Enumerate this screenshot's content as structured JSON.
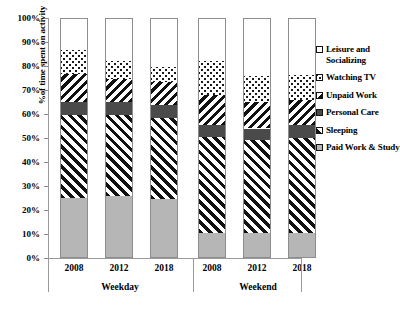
{
  "chart_data": {
    "type": "bar",
    "stacked": true,
    "title": "",
    "xlabel": "",
    "ylabel": "%of time spent on activity",
    "ylim": [
      0,
      100
    ],
    "grid": false,
    "legend_position": "right",
    "categories": [
      "2008",
      "2012",
      "2018",
      "2008",
      "2012",
      "2018"
    ],
    "groups": [
      {
        "label": "Weekday",
        "categories": [
          "2008",
          "2012",
          "2018"
        ]
      },
      {
        "label": "Weekend",
        "categories": [
          "2008",
          "2012",
          "2018"
        ]
      }
    ],
    "y_ticks": [
      "0%",
      "10%",
      "20%",
      "30%",
      "40%",
      "50%",
      "60%",
      "70%",
      "80%",
      "90%",
      "100%"
    ],
    "series": [
      {
        "name": "Paid Work & Study",
        "pattern": "solid-gray",
        "color": "#b6b6b6",
        "values": [
          25,
          25.5,
          24.5,
          10,
          10,
          10
        ]
      },
      {
        "name": "Sleeping",
        "pattern": "diagonal-hatch-up",
        "color": "#111111",
        "values": [
          34.5,
          34,
          34,
          40.5,
          39,
          40
        ]
      },
      {
        "name": "Personal Care",
        "pattern": "solid-dark",
        "color": "#4a4a4a",
        "values": [
          5.5,
          5.5,
          5.5,
          5,
          5,
          5.5
        ]
      },
      {
        "name": "Unpaid Work",
        "pattern": "diagonal-hatch-down",
        "color": "#111111",
        "values": [
          12,
          10,
          9.5,
          12.5,
          11,
          10.5
        ]
      },
      {
        "name": "Watching TV",
        "pattern": "checkerboard-dots",
        "color": "#1a1a1a",
        "values": [
          10,
          7.5,
          6.5,
          14.5,
          11,
          10.5
        ]
      },
      {
        "name": "Leisure and Socializing",
        "pattern": "white",
        "color": "#ffffff",
        "values": [
          13,
          17.5,
          20,
          17.5,
          24,
          23.5
        ]
      }
    ]
  },
  "legend": {
    "items": [
      {
        "label": "Leisure and Socializing",
        "swatch": "white-swatch"
      },
      {
        "label": "Watching TV",
        "swatch": "checkerboard-swatch"
      },
      {
        "label": "Unpaid Work",
        "swatch": "diagonal-down-swatch"
      },
      {
        "label": "Personal Care",
        "swatch": "dark-solid-swatch"
      },
      {
        "label": "Sleeping",
        "swatch": "diagonal-up-swatch"
      },
      {
        "label": "Paid Work & Study",
        "swatch": "gray-solid-swatch"
      }
    ]
  }
}
